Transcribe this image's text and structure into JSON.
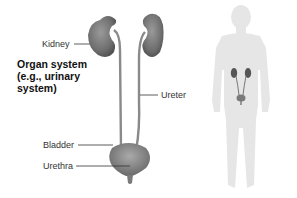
{
  "diagram": {
    "title_lines": [
      "Organ system",
      "(e.g., urinary",
      "system)"
    ],
    "labels": {
      "kidney": "Kidney",
      "ureter": "Ureter",
      "bladder": "Bladder",
      "urethra": "Urethra"
    },
    "colors": {
      "organ": "#7a7a7a",
      "organ_dark": "#555555",
      "body_silhouette": "#e6e6e6",
      "leader_line": "#333333"
    }
  }
}
